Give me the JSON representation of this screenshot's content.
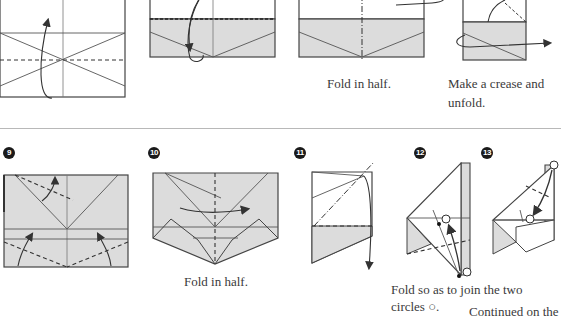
{
  "colors": {
    "line": "#4a4a4a",
    "shade": "#dcdcdc",
    "background": "#ffffff",
    "badge": "#1a1a1a",
    "divider": "#b8b8b8"
  },
  "top_row": {
    "steps": [
      {
        "id": "step-5",
        "caption": ""
      },
      {
        "id": "step-6",
        "caption": ""
      },
      {
        "id": "step-7",
        "caption": "Fold in half."
      },
      {
        "id": "step-8",
        "caption_line1": "Make a crease and",
        "caption_line2": "unfold."
      }
    ]
  },
  "bottom_row": {
    "steps": [
      {
        "number": "9",
        "caption": ""
      },
      {
        "number": "10",
        "caption": "Fold in half."
      },
      {
        "number": "11",
        "caption": ""
      },
      {
        "number": "12",
        "caption_line1": "Fold so as to join the two",
        "caption_line2": "circles",
        "circle_symbol": "○."
      },
      {
        "number": "13",
        "caption": ""
      }
    ]
  },
  "footer": {
    "continued": "Continued on the"
  }
}
